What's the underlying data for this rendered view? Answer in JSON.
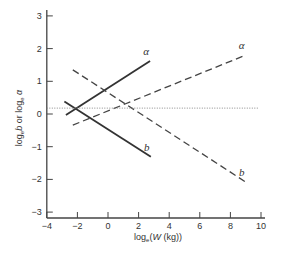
{
  "chart_data": {
    "type": "line",
    "title": "",
    "xlabel": "log_e(W (kg))",
    "xlabel_parts": {
      "pre": "log",
      "sub": "e",
      "post": "(W (kg))"
    },
    "ylabel": "log_e b or log_e α",
    "ylabel_parts": [
      "log",
      "e",
      "b or log",
      "e",
      "α"
    ],
    "xlim": [
      -4,
      10
    ],
    "ylim": [
      -3.2,
      3.2
    ],
    "x_ticks": [
      -4,
      -2,
      0,
      2,
      4,
      6,
      8,
      10
    ],
    "x_tick_labels": [
      "−4",
      "−2",
      "0",
      "2",
      "4",
      "6",
      "8",
      "10"
    ],
    "y_ticks": [
      3,
      2,
      1,
      0,
      -1,
      -2,
      -3
    ],
    "y_tick_labels": [
      "3",
      "2",
      "1",
      "0",
      "−1",
      "−2",
      "−3"
    ],
    "grid": false,
    "legend": "none",
    "series": [
      {
        "name": "α (solid)",
        "label": "α",
        "style": "solid",
        "x": [
          -2.75,
          2.75
        ],
        "y": [
          -0.03,
          1.62
        ],
        "label_at": "end-top"
      },
      {
        "name": "b (solid)",
        "label": "b",
        "style": "solid",
        "x": [
          -2.85,
          2.8
        ],
        "y": [
          0.38,
          -1.31
        ],
        "label_at": "end-top"
      },
      {
        "name": "α (dashed)",
        "label": "α",
        "style": "dashed",
        "x": [
          -2.3,
          9.0
        ],
        "y": [
          -0.34,
          1.8
        ],
        "label_at": "end-top"
      },
      {
        "name": "b (dashed)",
        "label": "b",
        "style": "dashed",
        "x": [
          -2.3,
          9.0
        ],
        "y": [
          1.35,
          -2.08
        ],
        "label_at": "end-top"
      },
      {
        "name": "reference (dotted)",
        "label": "",
        "style": "dotted",
        "x": [
          -4,
          9.8
        ],
        "y": [
          0.18,
          0.18
        ]
      }
    ]
  }
}
